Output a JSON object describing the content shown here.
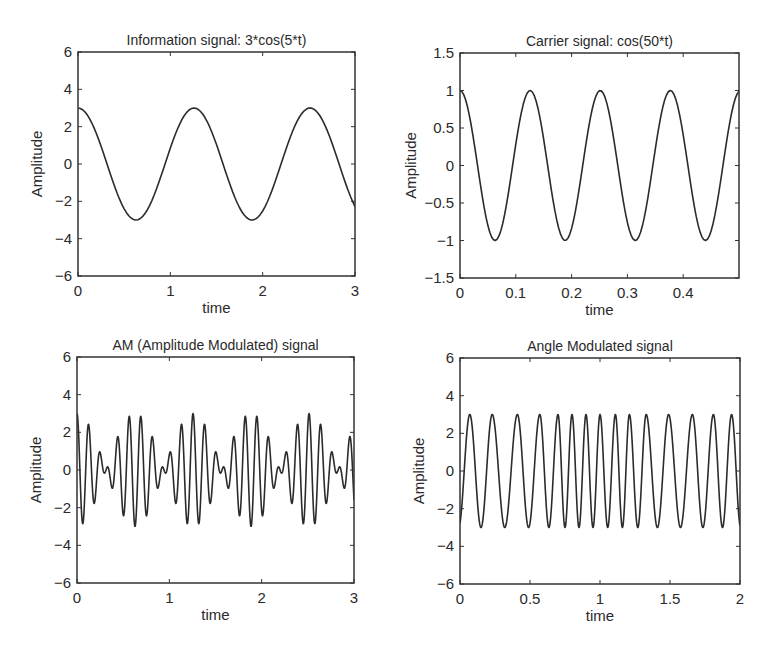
{
  "figure": {
    "background": "#ffffff",
    "line_color": "#2b2b2b",
    "axes_color": "#333333"
  },
  "chart_data": [
    {
      "type": "line",
      "title": "Information signal: 3*cos(5*t)",
      "xlabel": "time",
      "ylabel": "Amplitude",
      "xlim": [
        0,
        3
      ],
      "ylim": [
        -6,
        6
      ],
      "xticks": [
        0,
        1,
        2,
        3
      ],
      "xtick_labels": [
        "0",
        "1",
        "2",
        "3"
      ],
      "yticks": [
        -6,
        -4,
        -2,
        0,
        2,
        4,
        6
      ],
      "ytick_labels": [
        "−6",
        "−4",
        "−2",
        "0",
        "2",
        "4",
        "6"
      ],
      "grid": false,
      "legend": null,
      "series": [
        {
          "name": "x(t)",
          "expression": "3*cos(5*t)",
          "t_start": 0,
          "t_end": 3,
          "samples": 120
        }
      ],
      "box_px": {
        "left": 78,
        "top": 52,
        "right": 355,
        "bottom": 276
      }
    },
    {
      "type": "line",
      "title": "Carrier signal: cos(50*t)",
      "xlabel": "time",
      "ylabel": "Amplitude",
      "xlim": [
        0,
        0.5
      ],
      "ylim": [
        -1.5,
        1.5
      ],
      "xticks": [
        0,
        0.1,
        0.2,
        0.3,
        0.4
      ],
      "xtick_labels": [
        "0",
        "0.1",
        "0.2",
        "0.3",
        "0.4"
      ],
      "yticks": [
        -1.5,
        -1,
        -0.5,
        0,
        0.5,
        1,
        1.5
      ],
      "ytick_labels": [
        "−1.5",
        "−1",
        "−0.5",
        "0",
        "0.5",
        "1",
        "1.5"
      ],
      "grid": false,
      "legend": null,
      "series": [
        {
          "name": "c(t)",
          "expression": "cos(50*t)",
          "t_start": 0,
          "t_end": 0.5,
          "samples": 150
        }
      ],
      "box_px": {
        "left": 460,
        "top": 53,
        "right": 739,
        "bottom": 278
      }
    },
    {
      "type": "line",
      "title": "AM (Amplitude Modulated) signal",
      "xlabel": "time",
      "ylabel": "Amplitude",
      "xlim": [
        0,
        3
      ],
      "ylim": [
        -6,
        6
      ],
      "xticks": [
        0,
        1,
        2,
        3
      ],
      "xtick_labels": [
        "0",
        "1",
        "2",
        "3"
      ],
      "yticks": [
        -6,
        -4,
        -2,
        0,
        2,
        4,
        6
      ],
      "ytick_labels": [
        "−6",
        "−4",
        "−2",
        "0",
        "2",
        "4",
        "6"
      ],
      "grid": false,
      "legend": null,
      "series": [
        {
          "name": "x(t)*c(t)",
          "expression": "3*cos(5*t)*cos(50*t)",
          "t_start": 0,
          "t_end": 3,
          "samples": 900
        }
      ],
      "box_px": {
        "left": 77,
        "top": 357,
        "right": 354,
        "bottom": 583
      }
    },
    {
      "type": "line",
      "title": "Angle Modulated signal",
      "xlabel": "time",
      "ylabel": "Amplitude",
      "xlim": [
        0,
        2
      ],
      "ylim": [
        -6,
        6
      ],
      "xticks": [
        0,
        0.5,
        1,
        1.5,
        2
      ],
      "xtick_labels": [
        "0",
        "0.5",
        "1",
        "1.5",
        "2"
      ],
      "yticks": [
        -6,
        -4,
        -2,
        0,
        2,
        4,
        6
      ],
      "ytick_labels": [
        "−6",
        "−4",
        "−2",
        "0",
        "2",
        "4",
        "6"
      ],
      "grid": false,
      "legend": null,
      "series": [
        {
          "name": "angle-modulated",
          "amplitude": 3,
          "peak_times": [
            0.07,
            0.23,
            0.41,
            0.57,
            0.7,
            0.8,
            0.9,
            1.0,
            1.11,
            1.21,
            1.33,
            1.49,
            1.66,
            1.81,
            1.94
          ],
          "t_start": 0,
          "t_end": 2,
          "samples": 900
        }
      ],
      "box_px": {
        "left": 460,
        "top": 358,
        "right": 740,
        "bottom": 584
      }
    }
  ]
}
